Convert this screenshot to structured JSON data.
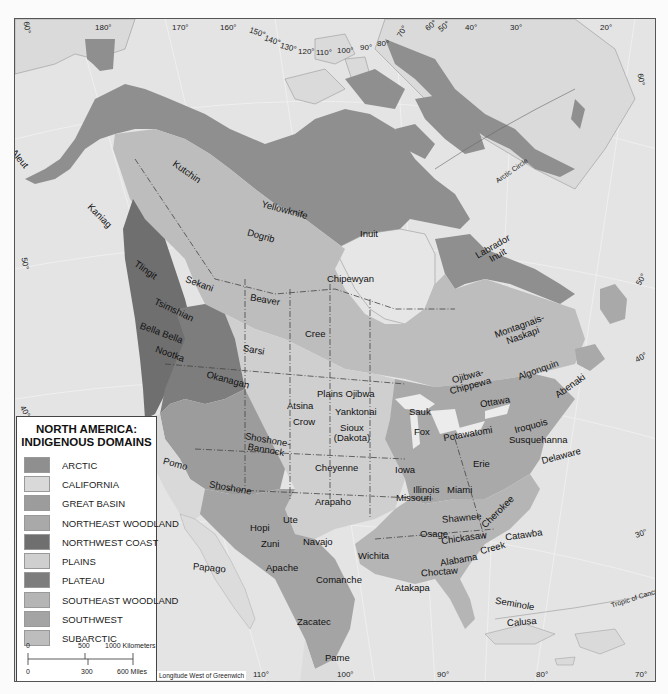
{
  "legend": {
    "title_line1": "NORTH AMERICA:",
    "title_line2": "INDIGENOUS DOMAINS",
    "items": [
      {
        "label": "ARCTIC",
        "color": "#8f8f8f"
      },
      {
        "label": "CALIFORNIA",
        "color": "#d9d9d9"
      },
      {
        "label": "GREAT BASIN",
        "color": "#9c9c9c"
      },
      {
        "label": "NORTHEAST WOODLAND",
        "color": "#a9a9a9"
      },
      {
        "label": "NORTHWEST COAST",
        "color": "#6f6f6f"
      },
      {
        "label": "PLAINS",
        "color": "#cfcfcf"
      },
      {
        "label": "PLATEAU",
        "color": "#7d7d7d"
      },
      {
        "label": "SOUTHEAST WOODLAND",
        "color": "#b5b5b5"
      },
      {
        "label": "SOUTHWEST",
        "color": "#a4a4a4"
      },
      {
        "label": "SUBARCTIC",
        "color": "#bdbdbd"
      }
    ],
    "scale": {
      "km_ticks": [
        "0",
        "500",
        "1000 Kilometers"
      ],
      "mile_ticks": [
        "0",
        "300",
        "600 Miles"
      ]
    }
  },
  "map": {
    "longitude_note": "Longitude West of Greenwich",
    "colors": {
      "ocean": "#e4e4e4",
      "land_other": "#dedede",
      "lakes": "#ececec",
      "border": "#444444"
    },
    "top_degrees": [
      "180°",
      "170°",
      "160°",
      "150°",
      "140°",
      "130°",
      "120°",
      "110°",
      "100°",
      "90°",
      "80°",
      "70°",
      "60°",
      "50°",
      "40°",
      "30°",
      "20°"
    ],
    "side_degrees": [
      "60°",
      "50°",
      "40°",
      "30°",
      "70°"
    ],
    "bottom_degrees": [
      "110°",
      "100°",
      "90°",
      "80°",
      "70°"
    ],
    "lines": {
      "arctic_circle": "Arctic Circle",
      "tropic_of_cancer": "Tropic of Cancer"
    },
    "peoples": [
      {
        "name": "Aleut"
      },
      {
        "name": "Kaniag"
      },
      {
        "name": "Kutchin"
      },
      {
        "name": "Yellowknife"
      },
      {
        "name": "Dogrib"
      },
      {
        "name": "Inuit"
      },
      {
        "name": "Labrador Inuit"
      },
      {
        "name": "Tlingit"
      },
      {
        "name": "Sekani"
      },
      {
        "name": "Beaver"
      },
      {
        "name": "Chipewyan"
      },
      {
        "name": "Tsimshian"
      },
      {
        "name": "Bella Bella"
      },
      {
        "name": "Nootka"
      },
      {
        "name": "Sarsi"
      },
      {
        "name": "Cree"
      },
      {
        "name": "Montagnais-Naskapi"
      },
      {
        "name": "Okanagan"
      },
      {
        "name": "Plains Ojibwa"
      },
      {
        "name": "Ojibwa-Chippewa"
      },
      {
        "name": "Algonquin"
      },
      {
        "name": "Abenaki"
      },
      {
        "name": "Ottawa"
      },
      {
        "name": "Atsina"
      },
      {
        "name": "Yanktonai"
      },
      {
        "name": "Crow"
      },
      {
        "name": "Shoshone-Bannock"
      },
      {
        "name": "Sioux (Dakota)"
      },
      {
        "name": "Sauk"
      },
      {
        "name": "Fox"
      },
      {
        "name": "Potawatomi"
      },
      {
        "name": "Iroquois"
      },
      {
        "name": "Susquehanna"
      },
      {
        "name": "Pomo"
      },
      {
        "name": "Cheyenne"
      },
      {
        "name": "Iowa"
      },
      {
        "name": "Erie"
      },
      {
        "name": "Delaware"
      },
      {
        "name": "Shoshone"
      },
      {
        "name": "Illinois"
      },
      {
        "name": "Miami"
      },
      {
        "name": "Missouri"
      },
      {
        "name": "Arapaho"
      },
      {
        "name": "Ute"
      },
      {
        "name": "Shawnee"
      },
      {
        "name": "Cherokee"
      },
      {
        "name": "Hopi"
      },
      {
        "name": "Zuni"
      },
      {
        "name": "Navajo"
      },
      {
        "name": "Osage"
      },
      {
        "name": "Chickasaw"
      },
      {
        "name": "Catawba"
      },
      {
        "name": "Wichita"
      },
      {
        "name": "Creek"
      },
      {
        "name": "Papago"
      },
      {
        "name": "Apache"
      },
      {
        "name": "Comanche"
      },
      {
        "name": "Alabama"
      },
      {
        "name": "Choctaw"
      },
      {
        "name": "Atakapa"
      },
      {
        "name": "Seminole"
      },
      {
        "name": "Calusa"
      },
      {
        "name": "Zacatec"
      },
      {
        "name": "Pame"
      }
    ]
  }
}
